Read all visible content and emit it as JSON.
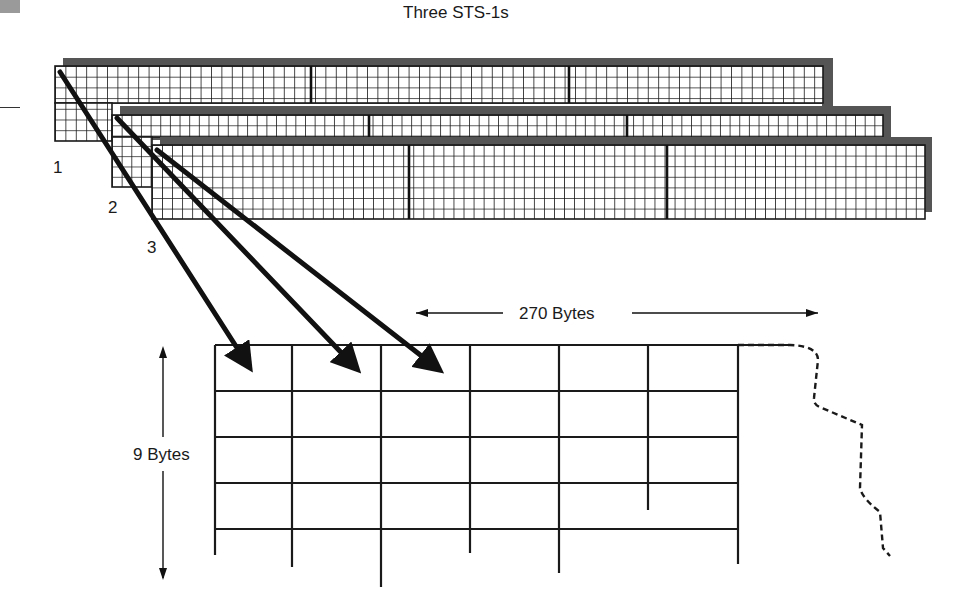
{
  "title": "Three STS-1s",
  "frames": [
    {
      "label": "1",
      "x": 55,
      "y": 66,
      "w": 768,
      "h": 75,
      "shadow": {
        "x": 63,
        "y": 58,
        "w": 770,
        "h": 78
      },
      "separators": [
        311,
        569
      ],
      "rows": 7
    },
    {
      "label": "2",
      "x": 112,
      "y": 115,
      "w": 771,
      "h": 72,
      "shadow": {
        "x": 120,
        "y": 106,
        "w": 771,
        "h": 34
      },
      "separators": [
        369,
        627
      ],
      "rows": 7
    },
    {
      "label": "3",
      "x": 152,
      "y": 145,
      "w": 773,
      "h": 74,
      "shadow": {
        "x": 160,
        "y": 137,
        "w": 772,
        "h": 75
      },
      "separators": [
        409,
        667
      ],
      "rows": 7
    }
  ],
  "frame_labels": [
    {
      "text": "1",
      "x": 53,
      "y": 158
    },
    {
      "text": "2",
      "x": 108,
      "y": 198
    },
    {
      "text": "3",
      "x": 147,
      "y": 238
    }
  ],
  "width_label": "270 Bytes",
  "height_label": "9 Bytes",
  "output_frame": {
    "columns": [
      215,
      292,
      381,
      470,
      559,
      648,
      738
    ],
    "rows": [
      345,
      391,
      437,
      483,
      529
    ],
    "col_bottoms": [
      555,
      567,
      587,
      553,
      573,
      510,
      564
    ]
  },
  "arrows": [
    {
      "from": "frame-1",
      "x1": 60,
      "y1": 72,
      "x2": 248,
      "y2": 365
    },
    {
      "from": "frame-2",
      "x1": 117,
      "y1": 118,
      "x2": 355,
      "y2": 367
    },
    {
      "from": "frame-3",
      "x1": 157,
      "y1": 150,
      "x2": 437,
      "y2": 368
    }
  ],
  "colors": {
    "grid": "#1a1a1a",
    "shadow": "#555555",
    "paper": "#ffffff"
  }
}
